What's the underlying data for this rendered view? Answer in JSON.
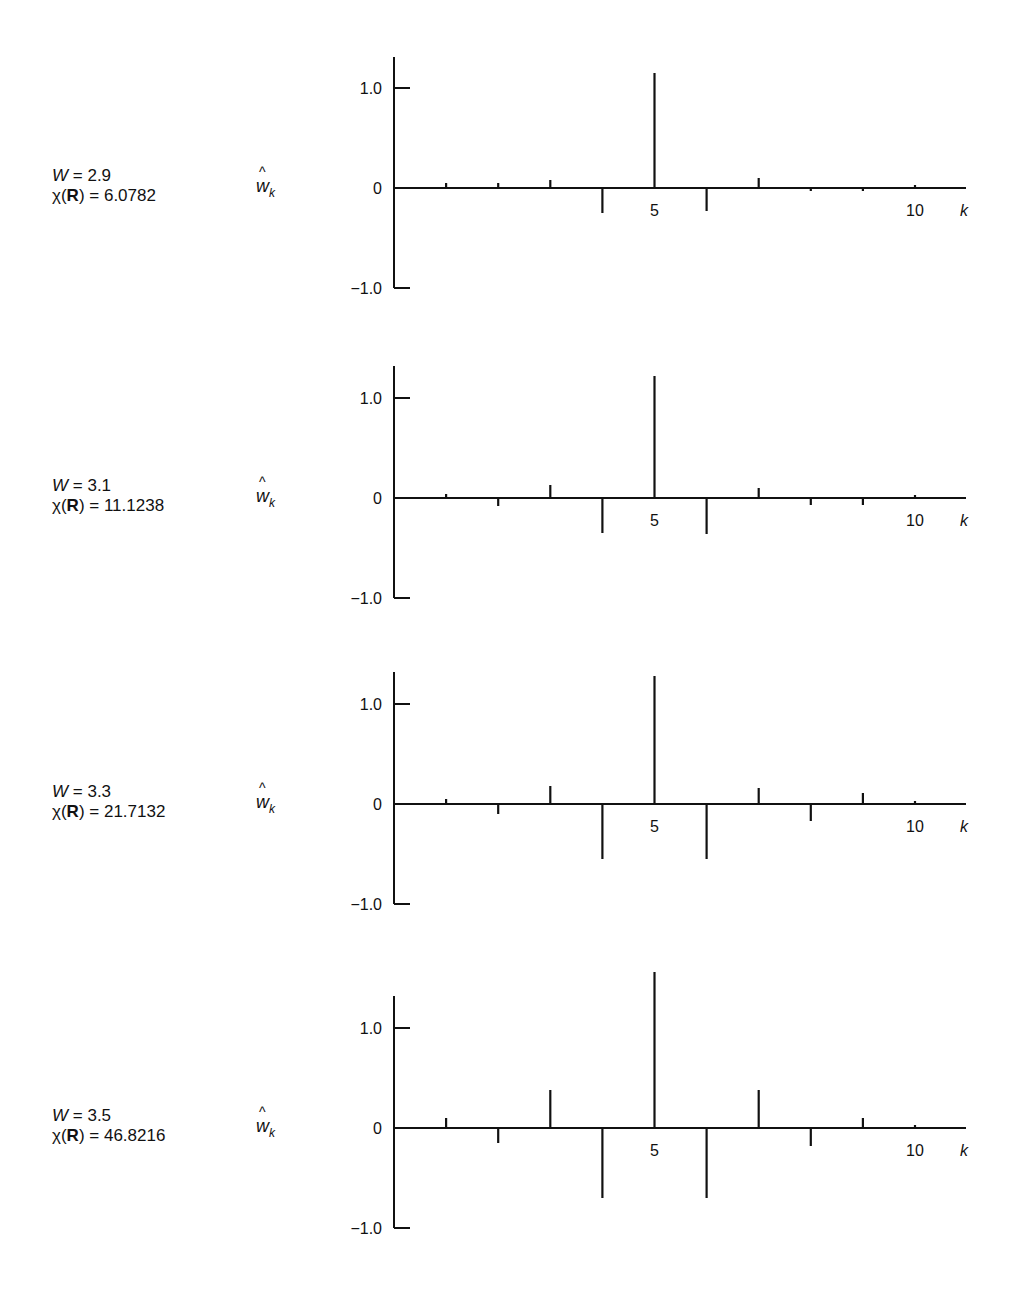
{
  "chart_data": [
    {
      "type": "bar",
      "subtype": "stem",
      "params": {
        "W_label": "W",
        "W_value": "2.9",
        "chi_label": "χ(R)",
        "chi_value": "6.0782"
      },
      "ylabel": "ŵ_k",
      "xlabel": "k",
      "x": [
        1,
        2,
        3,
        4,
        5,
        6,
        7,
        8,
        9,
        10
      ],
      "values": [
        0.05,
        0.05,
        0.08,
        -0.25,
        1.15,
        -0.23,
        0.1,
        -0.02,
        -0.02,
        0.01
      ],
      "yticks": [
        "1.0",
        "0",
        "−1.0"
      ],
      "xticks": [
        "5",
        "10"
      ],
      "ylim": [
        -1.0,
        1.3
      ],
      "xlim": [
        0,
        11
      ]
    },
    {
      "type": "bar",
      "subtype": "stem",
      "params": {
        "W_label": "W",
        "W_value": "3.1",
        "chi_label": "χ(R)",
        "chi_value": "11.1238"
      },
      "ylabel": "ŵ_k",
      "xlabel": "k",
      "x": [
        1,
        2,
        3,
        4,
        5,
        6,
        7,
        8,
        9,
        10
      ],
      "values": [
        0.04,
        -0.08,
        0.13,
        -0.35,
        1.22,
        -0.36,
        0.1,
        -0.07,
        -0.07,
        0.01
      ],
      "yticks": [
        "1.0",
        "0",
        "−1.0"
      ],
      "xticks": [
        "5",
        "10"
      ],
      "ylim": [
        -1.0,
        1.3
      ],
      "xlim": [
        0,
        11
      ]
    },
    {
      "type": "bar",
      "subtype": "stem",
      "params": {
        "W_label": "W",
        "W_value": "3.3",
        "chi_label": "χ(R)",
        "chi_value": "21.7132"
      },
      "ylabel": "ŵ_k",
      "xlabel": "k",
      "x": [
        1,
        2,
        3,
        4,
        5,
        6,
        7,
        8,
        9,
        10
      ],
      "values": [
        0.05,
        -0.1,
        0.18,
        -0.55,
        1.28,
        -0.55,
        0.16,
        -0.17,
        0.11,
        0.01
      ],
      "yticks": [
        "1.0",
        "0",
        "−1.0"
      ],
      "xticks": [
        "5",
        "10"
      ],
      "ylim": [
        -1.0,
        1.3
      ],
      "xlim": [
        0,
        11
      ]
    },
    {
      "type": "bar",
      "subtype": "stem",
      "params": {
        "W_label": "W",
        "W_value": "3.5",
        "chi_label": "χ(R)",
        "chi_value": "46.8216"
      },
      "ylabel": "ŵ_k",
      "xlabel": "k",
      "x": [
        1,
        2,
        3,
        4,
        5,
        6,
        7,
        8,
        9,
        10
      ],
      "values": [
        0.1,
        -0.15,
        0.38,
        -0.7,
        1.56,
        -0.7,
        0.38,
        -0.18,
        0.1,
        0.01
      ],
      "yticks": [
        "1.0",
        "0",
        "−1.0"
      ],
      "xticks": [
        "5",
        "10"
      ],
      "ylim": [
        -1.0,
        1.3
      ],
      "xlim": [
        0,
        11
      ]
    }
  ],
  "panels": [
    {
      "W_value": "2.9",
      "chi_value": "6.0782"
    },
    {
      "W_value": "3.1",
      "chi_value": "11.1238"
    },
    {
      "W_value": "3.3",
      "chi_value": "21.7132"
    },
    {
      "W_value": "3.5",
      "chi_value": "46.8216"
    }
  ],
  "labels": {
    "W": "W",
    "equals": " = ",
    "chi": "χ(",
    "R": "R",
    "chi_close": ") = ",
    "w": "w",
    "hat": "^",
    "sub_k": "k",
    "xlabel": "k",
    "ytick_top": "1.0",
    "ytick_zero": "0",
    "ytick_bottom": "−1.0",
    "xtick_5": "5",
    "xtick_10": "10"
  },
  "layout": {
    "baselines": [
      188,
      498,
      804,
      1128
    ],
    "axis_tops": [
      57,
      366,
      672,
      996
    ],
    "px_per_unit_y": 100,
    "k0_x": 394,
    "px_per_k": 52.1,
    "axis_right_x": 966
  }
}
